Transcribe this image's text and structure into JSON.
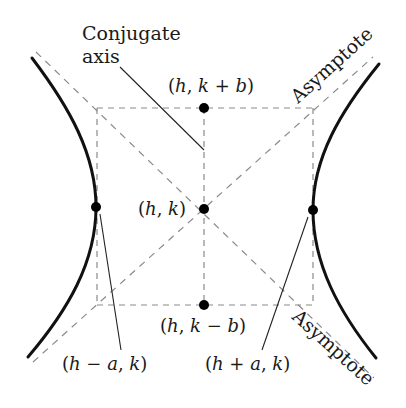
{
  "diagram": {
    "type": "hyperbola-horizontal-transverse-axis",
    "colors": {
      "background": "#ffffff",
      "curve": "#111111",
      "dashed": "#8a8a8a",
      "leader": "#222222",
      "point": "#000000",
      "text": "#1a1a1a"
    },
    "labels": {
      "conjugate_axis_line1": "Conjugate",
      "conjugate_axis_line2": "axis",
      "asymptote_upper": "Asymptote",
      "asymptote_lower": "Asymptote"
    },
    "points": {
      "center": {
        "label": "(h, k)",
        "x": 204,
        "y": 209
      },
      "top": {
        "label": "(h, k + b)",
        "x": 204,
        "y": 108
      },
      "bottom": {
        "label": "(h, k − b)",
        "x": 204,
        "y": 305
      },
      "left_vertex": {
        "label": "(h − a, k)",
        "x": 96,
        "y": 207
      },
      "right_vertex": {
        "label": "(h + a, k)",
        "x": 313,
        "y": 210
      }
    },
    "point_text": {
      "center_open": "(",
      "center_h": "h",
      "center_comma": ", ",
      "center_k": "k",
      "center_close": ")",
      "top_open": "(",
      "top_h": "h",
      "top_comma": ", ",
      "top_k": "k",
      "top_op": " + ",
      "top_b": "b",
      "top_close": ")",
      "bottom_open": "(",
      "bottom_h": "h",
      "bottom_comma": ", ",
      "bottom_k": "k",
      "bottom_op": " − ",
      "bottom_b": "b",
      "bottom_close": ")",
      "left_open": "(",
      "left_h": "h",
      "left_op": " − ",
      "left_a": "a",
      "left_comma": ", ",
      "left_k": "k",
      "left_close": ")",
      "right_open": "(",
      "right_h": "h",
      "right_op": " + ",
      "right_a": "a",
      "right_comma": ", ",
      "right_k": "k",
      "right_close": ")"
    }
  }
}
